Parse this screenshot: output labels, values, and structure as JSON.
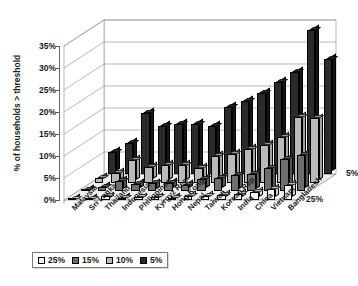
{
  "chart_data": {
    "type": "bar",
    "title": "",
    "subtitle": "",
    "xlabel": "",
    "ylabel": "% of households > threshold",
    "ylim": [
      0,
      35
    ],
    "ytick_labels": [
      "0%",
      "5%",
      "10%",
      "15%",
      "20%",
      "25%",
      "30%",
      "35%"
    ],
    "ytick_values": [
      0,
      5,
      10,
      15,
      20,
      25,
      30,
      35
    ],
    "grid": true,
    "projection": "3d",
    "legend_position": "bottom-left",
    "depth_axis_labels": [
      "5%",
      "25%"
    ],
    "categories": [
      "Malaysia",
      "Sri Lanka",
      "Thailand",
      "Indonesia",
      "Philippines",
      "Kyrgyz Rep.",
      "Hong Kong",
      "Nepal",
      "Taiwan",
      "Korean Rep.",
      "India",
      "China",
      "Vietnam",
      "Bangladesh"
    ],
    "series": [
      {
        "name": "5%",
        "color": "#2b2b2b",
        "values": [
          5.0,
          7.0,
          13.8,
          11.0,
          11.4,
          11.3,
          11.0,
          15.3,
          16.7,
          18.4,
          21.0,
          23.2,
          32.8,
          26.2
        ]
      },
      {
        "name": "10%",
        "color": "#b9b9b9",
        "values": [
          1.0,
          2.2,
          5.2,
          3.5,
          4.0,
          4.1,
          3.4,
          6.0,
          6.6,
          7.6,
          8.5,
          10.4,
          15.0,
          14.6
        ]
      },
      {
        "name": "15%",
        "color": "#6e6e6e",
        "values": [
          0.4,
          1.0,
          2.4,
          1.6,
          1.8,
          1.9,
          1.4,
          2.8,
          3.0,
          3.6,
          4.0,
          5.2,
          7.4,
          8.2
        ]
      },
      {
        "name": "25%",
        "color": "#f2f2f2",
        "values": [
          0.1,
          0.3,
          0.8,
          0.5,
          0.6,
          0.6,
          0.4,
          0.9,
          1.0,
          1.2,
          1.4,
          1.8,
          2.6,
          3.4
        ]
      }
    ],
    "legend": [
      {
        "label": "25%",
        "color": "#f2f2f2"
      },
      {
        "label": "15%",
        "color": "#6e6e6e"
      },
      {
        "label": "10%",
        "color": "#b9b9b9"
      },
      {
        "label": "5%",
        "color": "#2b2b2b"
      }
    ]
  }
}
